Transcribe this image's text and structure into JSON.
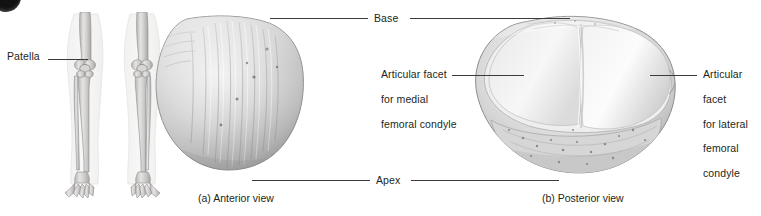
{
  "figure": {
    "badge": "figure-number-badge",
    "background_color": "#ffffff",
    "text_color": "#231f20",
    "leader_color": "#3b3b3d"
  },
  "orientation_panel": {
    "name": "leg-skeleton-orientation-figure",
    "label": "Patella"
  },
  "panels": [
    {
      "id": "anterior",
      "caption": "(a) Anterior view",
      "bone_name": "patella-anterior-view"
    },
    {
      "id": "posterior",
      "caption": "(b) Posterior view",
      "bone_name": "patella-posterior-view"
    }
  ],
  "annotations": {
    "base": "Base",
    "apex": "Apex",
    "medial_facet": [
      "Articular facet",
      "for medial",
      "femoral condyle"
    ],
    "lateral_facet": [
      "Articular",
      "facet",
      "for lateral",
      "femoral",
      "condyle"
    ]
  }
}
